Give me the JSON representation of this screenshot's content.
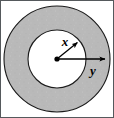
{
  "figure": {
    "type": "geometry-diagram",
    "canvas": {
      "width": 114,
      "height": 118
    },
    "border": {
      "visible": true,
      "color": "#55595c",
      "width": 1
    },
    "background_color": "#ffffff",
    "annulus": {
      "name": "shaded-ring",
      "fill_color": "#b9b9b9",
      "stroke_color": "#1a1a1a",
      "stroke_width": 1,
      "center": {
        "x": 57,
        "y": 59
      },
      "outer_radius": 53,
      "inner_radius": 29,
      "inner_fill_color": "#ffffff",
      "texture": "speckled"
    },
    "center_dot": {
      "name": "center-point",
      "radius": 2.6,
      "color": "#000000"
    },
    "radii": [
      {
        "id": "inner",
        "label": "x",
        "label_position": {
          "x": 65,
          "y": 46
        },
        "description": "inner radius arrow from center to inner circle",
        "arrow_from": {
          "x": 57,
          "y": 59
        },
        "arrow_to": {
          "x": 80,
          "y": 40
        },
        "stroke_color": "#000000",
        "stroke_width": 1.2
      },
      {
        "id": "outer",
        "label": "y",
        "label_position": {
          "x": 93,
          "y": 74
        },
        "description": "outer radius arrow from center past the outer circle",
        "arrow_from": {
          "x": 57,
          "y": 59
        },
        "arrow_to": {
          "x": 110,
          "y": 59
        },
        "stroke_color": "#000000",
        "stroke_width": 1.2
      }
    ],
    "label_font_size": 13
  }
}
